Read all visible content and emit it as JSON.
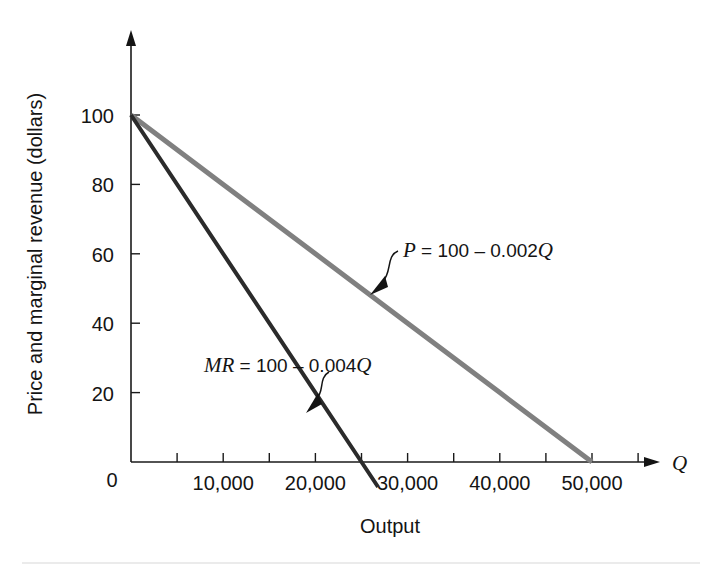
{
  "figure": {
    "background_color": "#ffffff",
    "footer_rule_color": "#d8d8d8"
  },
  "chart_data": {
    "type": "line",
    "title": "",
    "subtitle": "",
    "xlabel": "Output",
    "ylabel": "Price and marginal revenue (dollars)",
    "x_axis_variable": "Q",
    "xlim": [
      0,
      57500
    ],
    "ylim": [
      0,
      108
    ],
    "grid": false,
    "legend_position": "inline-annotations",
    "x_tick_values": [
      0,
      5000,
      10000,
      15000,
      20000,
      25000,
      30000,
      35000,
      40000,
      45000,
      50000,
      55000
    ],
    "x_tick_labels": [
      "",
      "",
      "10,000",
      "",
      "20,000",
      "",
      "30,000",
      "",
      "40,000",
      "",
      "50,000",
      ""
    ],
    "x_labeled_ticks": [
      {
        "value": 10000,
        "label": "10,000"
      },
      {
        "value": 20000,
        "label": "20,000"
      },
      {
        "value": 30000,
        "label": "30,000"
      },
      {
        "value": 40000,
        "label": "40,000"
      },
      {
        "value": 50000,
        "label": "50,000"
      }
    ],
    "y_tick_values": [
      0,
      20,
      40,
      60,
      80,
      100
    ],
    "y_tick_labels": [
      "0",
      "20",
      "40",
      "60",
      "80",
      "100"
    ],
    "origin_label": "0",
    "series": [
      {
        "name": "P",
        "label": "P = 100 – 0.002Q",
        "label_italic_part": "P",
        "label_rest": " = 100 – 0.002",
        "label_italic_tail": "Q",
        "equation": "P = 100 - 0.002Q",
        "intercept": 100,
        "slope": -0.002,
        "color": "#808080",
        "width": 5,
        "x": [
          0,
          50000
        ],
        "y": [
          100,
          0
        ],
        "points": [
          {
            "x": 0,
            "y": 100
          },
          {
            "x": 10000,
            "y": 80
          },
          {
            "x": 20000,
            "y": 60
          },
          {
            "x": 25000,
            "y": 50
          },
          {
            "x": 30000,
            "y": 40
          },
          {
            "x": 40000,
            "y": 20
          },
          {
            "x": 50000,
            "y": 0
          }
        ],
        "x_intercept": 50000
      },
      {
        "name": "MR",
        "label": "MR = 100 – 0.004Q",
        "label_italic_part": "MR",
        "label_rest": " = 100 – 0.004",
        "label_italic_tail": "Q",
        "equation": "MR = 100 - 0.004Q",
        "intercept": 100,
        "slope": -0.004,
        "color": "#2b2b2b",
        "width": 4,
        "x": [
          0,
          26800
        ],
        "y": [
          100,
          -7.2
        ],
        "points": [
          {
            "x": 0,
            "y": 100
          },
          {
            "x": 5000,
            "y": 80
          },
          {
            "x": 10000,
            "y": 60
          },
          {
            "x": 15000,
            "y": 40
          },
          {
            "x": 20000,
            "y": 20
          },
          {
            "x": 25000,
            "y": 0
          },
          {
            "x": 26800,
            "y": -7.2
          }
        ],
        "x_intercept": 25000
      }
    ],
    "annotations": [
      {
        "id": "demand-annotation",
        "text": "P = 100 – 0.002Q",
        "text_x": 400,
        "text_y": 253,
        "arrow_from_x": 392,
        "arrow_from_y": 258,
        "arrow_to_x": 370,
        "arrow_to_y": 294
      },
      {
        "id": "mr-annotation",
        "text": "MR = 100 – 0.004Q",
        "text_x": 200,
        "text_y": 368,
        "arrow_from_x": 325,
        "arrow_from_y": 374,
        "arrow_to_x": 309,
        "arrow_to_y": 410
      }
    ]
  },
  "geometry": {
    "plot_left": 131,
    "plot_bottom": 462,
    "plot_top": 46,
    "x_axis_end": 658,
    "y_axis_top": 34,
    "px_per_5000": 46.1,
    "px_per_20_units": 69.4
  }
}
